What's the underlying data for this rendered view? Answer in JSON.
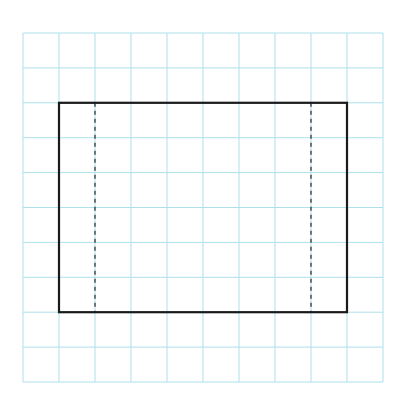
{
  "diagram": {
    "type": "grid-with-rectangle",
    "grid": {
      "columns": 10,
      "rows": 10,
      "origin_x": 23,
      "origin_y": 33,
      "cell_width": 36,
      "cell_height": 34.9,
      "line_color": "#aee0ea",
      "line_width": 1
    },
    "rectangle": {
      "col_start": 1,
      "col_end": 9,
      "row_start": 2,
      "row_end": 8,
      "stroke_color": "#1a1a1a",
      "stroke_width": 2.2
    },
    "dashed_lines": [
      {
        "col": 2,
        "row_start": 2,
        "row_end": 8
      },
      {
        "col": 8,
        "row_start": 2,
        "row_end": 8
      }
    ],
    "dashed_style": {
      "stroke_color": "#333333",
      "stroke_width": 1.3,
      "dash": "4 4"
    }
  }
}
